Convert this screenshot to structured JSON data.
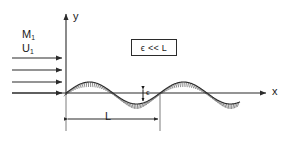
{
  "figure": {
    "background_color": "#ffffff",
    "line_color": "#2b2b2b",
    "text_color": "#1a1a1a"
  },
  "axes": {
    "y_label": "y",
    "x_label": "x",
    "origin_px": [
      66,
      93
    ],
    "y_axis_top_px": 12,
    "x_axis_right_px": 268
  },
  "inflow": {
    "mach_symbol": "M",
    "mach_subscript": "1",
    "velocity_symbol": "U",
    "velocity_subscript": "1",
    "arrow_count": 4,
    "arrow_start_x": 12,
    "arrow_end_x": 64,
    "arrow_y_positions": [
      58,
      70,
      82,
      93
    ]
  },
  "annotation_box": {
    "text": "ϵ << L",
    "border_color": "#2b2b2b"
  },
  "amplitude": {
    "label": "ϵ",
    "arrow_top_y": 89,
    "arrow_bottom_y": 101
  },
  "wavelength": {
    "label": "L",
    "dimension_line_y": 119,
    "left_x": 66,
    "right_x": 160,
    "extension_left_top_y": 95,
    "extension_right_top_y": 95,
    "extension_bottom_y": 131
  },
  "chart_data": {
    "type": "line",
    "xlabel": "x",
    "ylabel": "y",
    "grid": false,
    "legend": false,
    "wall_profile": {
      "equation": "y = ϵ sin(2πx / L)",
      "amplitude_symbol": "ϵ",
      "wavelength_symbol": "L",
      "wavelength_px": 94,
      "amplitude_px": 11,
      "start_x_px": 66,
      "end_x_px": 240,
      "baseline_y_px": 93,
      "hatching": "below-surface",
      "hatch_count": 96,
      "hatch_length_px": 5
    },
    "annotations": [
      {
        "text": "M₁",
        "x_px": 22,
        "y_px": 29
      },
      {
        "text": "U₁",
        "x_px": 22,
        "y_px": 43
      },
      {
        "text": "ϵ << L",
        "x_px": 154,
        "y_px": 48
      },
      {
        "text": "ϵ",
        "x_px": 148,
        "y_px": 93
      },
      {
        "text": "L",
        "x_px": 108,
        "y_px": 116
      },
      {
        "text": "y",
        "x_px": 74,
        "y_px": 16
      },
      {
        "text": "x",
        "x_px": 273,
        "y_px": 91
      }
    ]
  }
}
